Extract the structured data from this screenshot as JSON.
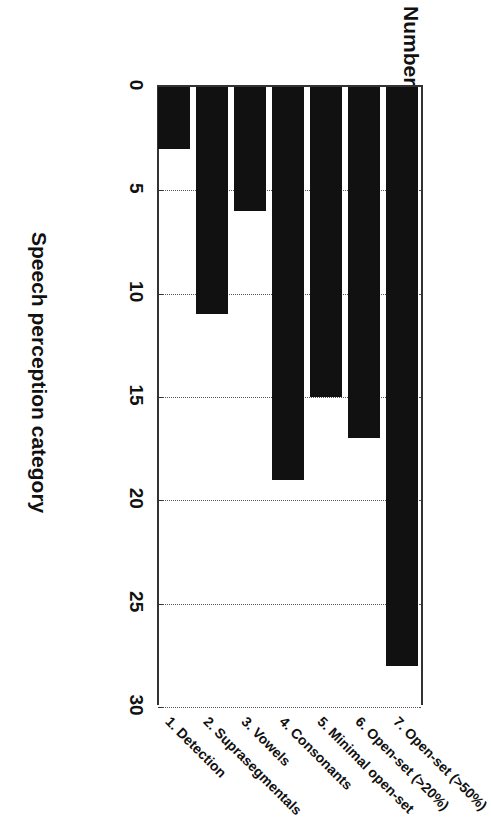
{
  "chart_data": {
    "type": "bar",
    "orientation": "vertical",
    "title": "",
    "xlabel": "Speech perception category",
    "ylabel": "Number of children",
    "ylim": [
      0,
      30
    ],
    "ytick_values": [
      0,
      5,
      10,
      15,
      20,
      25,
      30
    ],
    "ytick_labels": [
      "0",
      "5",
      "10",
      "15",
      "20",
      "25",
      "30"
    ],
    "grid": "dotted vertical gridlines at each tick",
    "legend": "none",
    "bar_color": "#111111",
    "categories": [
      "1. Detection",
      "2. Suprasegmentals",
      "3. Vowels",
      "4. Consonants",
      "5. Minimal open-set",
      "6. Open-set (>20%)",
      "7. Open-set (>50%)"
    ],
    "values": [
      3,
      11,
      6,
      19,
      15,
      17,
      28
    ],
    "series": [
      {
        "name": "Number of children",
        "values": [
          3,
          11,
          6,
          19,
          15,
          17,
          28
        ]
      }
    ]
  },
  "axes": {
    "value_axis_title": "Number of children",
    "category_axis_title": "Speech perception category"
  },
  "ticks": {
    "labels": [
      "0",
      "5",
      "10",
      "15",
      "20",
      "25",
      "30"
    ]
  },
  "categories": {
    "labels": [
      "1. Detection",
      "2. Suprasegmentals",
      "3. Vowels",
      "4. Consonants",
      "5. Minimal open-set",
      "6. Open-set (>20%)",
      "7. Open-set (>50%)"
    ]
  },
  "colors": {
    "bar": "#111111",
    "axis": "#333333",
    "grid": "#555555",
    "background": "#ffffff"
  }
}
